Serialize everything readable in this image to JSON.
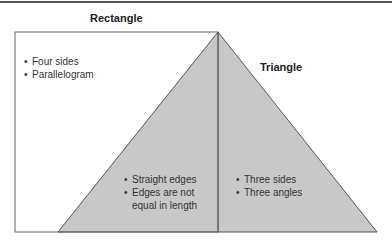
{
  "diagram": {
    "rectangle": {
      "title": "Rectangle",
      "items": [
        "Four sides",
        "Parallelogram"
      ]
    },
    "triangle": {
      "title": "Triangle",
      "items": [
        "Three sides",
        "Three angles"
      ]
    },
    "overlap": {
      "items": [
        "Straight edges",
        "Edges are not",
        "equal in length"
      ]
    },
    "colors": {
      "triangle_fill": "#c8c8c8",
      "stroke": "#555555",
      "background": "#ffffff"
    }
  }
}
